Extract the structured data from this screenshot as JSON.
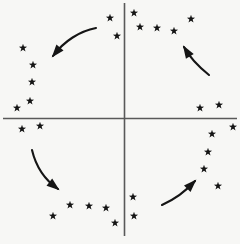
{
  "figure": {
    "title": "",
    "domain_type": "diagram",
    "background_color": "#f7f7f5",
    "marker_color": "#151515",
    "axis_color": "#595959",
    "arrow_color": "#151515",
    "width": 240,
    "height": 244
  },
  "axes": {
    "origin": {
      "x": 124.5,
      "y": 118.5
    },
    "horizontal": {
      "x1": 3,
      "y1": 118.5,
      "x2": 237,
      "y2": 118.5,
      "label": ""
    },
    "vertical": {
      "x1": 124.5,
      "y1": 3,
      "x2": 124.5,
      "y2": 236,
      "label": ""
    }
  },
  "chart_data": {
    "type": "scatter",
    "title": "",
    "xlabel": "",
    "ylabel": "",
    "marker": "star",
    "marker_size": 9,
    "grid": false,
    "legend": null,
    "points": [
      {
        "x": 110,
        "y": 18
      },
      {
        "x": 134,
        "y": 13
      },
      {
        "x": 140,
        "y": 27
      },
      {
        "x": 117,
        "y": 36
      },
      {
        "x": 157,
        "y": 28
      },
      {
        "x": 174,
        "y": 31
      },
      {
        "x": 191,
        "y": 19
      },
      {
        "x": 200,
        "y": 108
      },
      {
        "x": 219,
        "y": 105
      },
      {
        "x": 233,
        "y": 127
      },
      {
        "x": 212,
        "y": 134
      },
      {
        "x": 208,
        "y": 152
      },
      {
        "x": 204,
        "y": 169
      },
      {
        "x": 218,
        "y": 186
      },
      {
        "x": 133,
        "y": 197
      },
      {
        "x": 134,
        "y": 216
      },
      {
        "x": 115,
        "y": 223
      },
      {
        "x": 106,
        "y": 208
      },
      {
        "x": 89,
        "y": 206
      },
      {
        "x": 70,
        "y": 205
      },
      {
        "x": 53,
        "y": 216
      },
      {
        "x": 17,
        "y": 108
      },
      {
        "x": 30,
        "y": 101
      },
      {
        "x": 32,
        "y": 82
      },
      {
        "x": 33,
        "y": 65
      },
      {
        "x": 23,
        "y": 48
      },
      {
        "x": 40,
        "y": 126
      },
      {
        "x": 22,
        "y": 129
      }
    ]
  },
  "arrows": [
    {
      "name": "top-left-arrow",
      "direction": "down-left",
      "quadrant": "upper-left",
      "path": "M 96 28 C 80 31 64 41 53 56",
      "head": "52 58 66 52 60 48"
    },
    {
      "name": "top-right-arrow",
      "direction": "up-left",
      "quadrant": "upper-right",
      "path": "M 209 75 C 199 67 190 58 184 47",
      "head": "181 44 191 49 185 54"
    },
    {
      "name": "bottom-left-arrow",
      "direction": "down-right",
      "quadrant": "lower-left",
      "path": "M 32 150 C 36 167 45 180 58 189",
      "head": "61 191 50 190 56 184"
    },
    {
      "name": "bottom-right-arrow",
      "direction": "up-right",
      "quadrant": "lower-right",
      "path": "M 162 205 C 173 200 186 191 195 181",
      "head": "198 178 191 188 188 181"
    }
  ]
}
